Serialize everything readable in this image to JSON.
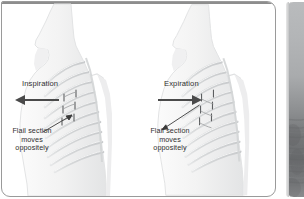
{
  "figure": {
    "panels": [
      {
        "id": "inspiration",
        "phase_label": "Inspiration",
        "arrow_direction": "left",
        "flail_caption": "Flail section moves oppositely",
        "flail_caption_lines": [
          "Flail section",
          "moves",
          "oppositely"
        ]
      },
      {
        "id": "expiration",
        "phase_label": "Expiration",
        "arrow_direction": "right",
        "flail_caption": "Flail section moves oppositely",
        "flail_caption_lines": [
          "Flail section",
          "moves",
          "oppositely"
        ]
      }
    ],
    "side_image": {
      "name": "radiograph-strip",
      "description": "partially visible grayscale radiograph panel"
    }
  },
  "colors": {
    "panel_border": "#9a9a9a",
    "text": "#2f2f2f",
    "arrow": "#4a4a4a",
    "body_fill": "#f2f2f2",
    "rib_stroke": "#b6b8ba",
    "background": "#ffffff"
  }
}
